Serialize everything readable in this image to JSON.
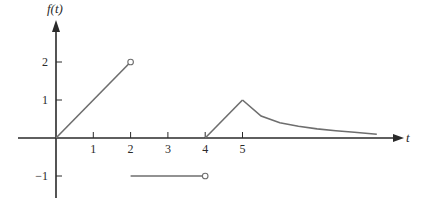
{
  "chart_data": {
    "type": "line",
    "title": "",
    "xlabel": "t",
    "ylabel": "f(t)",
    "xlim": [
      -1,
      9
    ],
    "ylim": [
      -1.6,
      2.9
    ],
    "x_ticks": [
      1,
      2,
      3,
      4,
      5
    ],
    "x_tick_labels": [
      "1",
      "2",
      "3",
      "4",
      "5"
    ],
    "y_ticks": [
      2,
      1,
      -1
    ],
    "y_tick_labels": [
      "2",
      "1",
      "−1"
    ],
    "grid": false,
    "legend": "none",
    "series": [
      {
        "name": "ramp",
        "points": [
          [
            0,
            0
          ],
          [
            2,
            2
          ]
        ],
        "end_marker": "open-circle"
      },
      {
        "name": "negative-constant",
        "points": [
          [
            2,
            -1
          ],
          [
            4,
            -1
          ]
        ],
        "end_marker": "open-circle"
      },
      {
        "name": "triangle-rise",
        "points": [
          [
            4,
            0
          ],
          [
            5,
            1
          ]
        ]
      },
      {
        "name": "decay",
        "points": [
          [
            5,
            1
          ],
          [
            5.5,
            0.58
          ],
          [
            6,
            0.4
          ],
          [
            6.5,
            0.31
          ],
          [
            7,
            0.24
          ],
          [
            7.5,
            0.19
          ],
          [
            8,
            0.15
          ],
          [
            8.6,
            0.1
          ]
        ]
      }
    ]
  }
}
